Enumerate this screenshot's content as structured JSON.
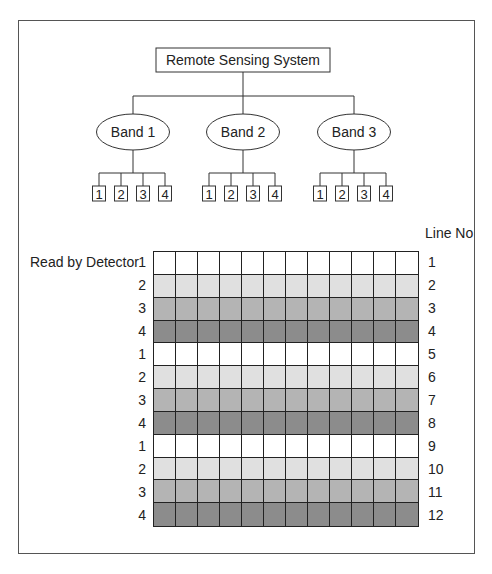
{
  "diagram": {
    "root": {
      "label": "Remote Sensing System"
    },
    "bands": [
      {
        "label": "Band 1",
        "detectors": [
          "1",
          "2",
          "3",
          "4"
        ]
      },
      {
        "label": "Band 2",
        "detectors": [
          "1",
          "2",
          "3",
          "4"
        ]
      },
      {
        "label": "Band 3",
        "detectors": [
          "1",
          "2",
          "3",
          "4"
        ]
      }
    ]
  },
  "grid": {
    "row_axis_label": "Read by Detector",
    "line_axis_label": "Line No",
    "columns": 12,
    "detector_colors": {
      "1": "#ffffff",
      "2": "#e0e0e0",
      "3": "#b4b4b4",
      "4": "#8c8c8c"
    },
    "rows": [
      {
        "detector": "1",
        "line": "1"
      },
      {
        "detector": "2",
        "line": "2"
      },
      {
        "detector": "3",
        "line": "3"
      },
      {
        "detector": "4",
        "line": "4"
      },
      {
        "detector": "1",
        "line": "5"
      },
      {
        "detector": "2",
        "line": "6"
      },
      {
        "detector": "3",
        "line": "7"
      },
      {
        "detector": "4",
        "line": "8"
      },
      {
        "detector": "1",
        "line": "9"
      },
      {
        "detector": "2",
        "line": "10"
      },
      {
        "detector": "3",
        "line": "11"
      },
      {
        "detector": "4",
        "line": "12"
      }
    ]
  }
}
